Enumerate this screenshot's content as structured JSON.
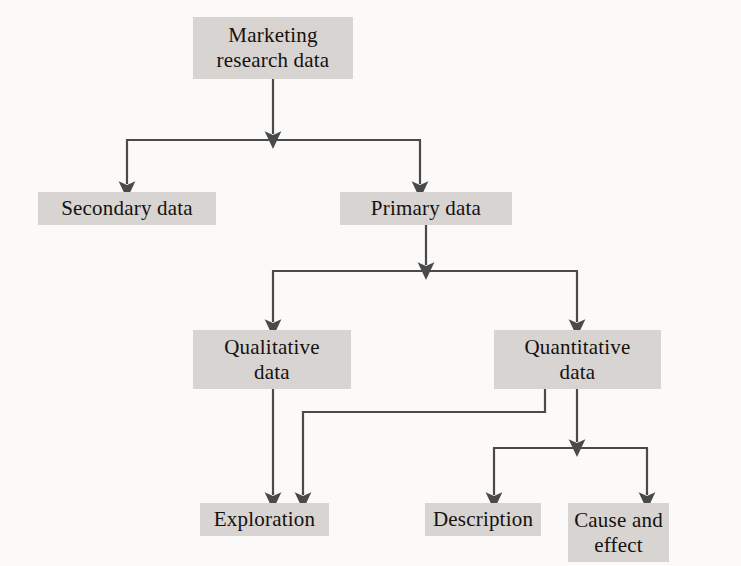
{
  "diagram": {
    "node_fill": "#d7d4d1",
    "line_color": "#4a4a4a",
    "background": "#fbfaf8",
    "nodes": [
      {
        "id": "root",
        "label": "Marketing\nresearch data"
      },
      {
        "id": "secondary",
        "label": "Secondary data"
      },
      {
        "id": "primary",
        "label": "Primary data"
      },
      {
        "id": "qualitative",
        "label": "Qualitative\ndata"
      },
      {
        "id": "quantitative",
        "label": "Quantitative\ndata"
      },
      {
        "id": "exploration",
        "label": "Exploration"
      },
      {
        "id": "description",
        "label": "Description"
      },
      {
        "id": "cause",
        "label": "Cause and\neffect"
      }
    ],
    "edges": [
      {
        "from": "root",
        "to": "secondary"
      },
      {
        "from": "root",
        "to": "primary"
      },
      {
        "from": "primary",
        "to": "qualitative"
      },
      {
        "from": "primary",
        "to": "quantitative"
      },
      {
        "from": "qualitative",
        "to": "exploration"
      },
      {
        "from": "quantitative",
        "to": "exploration"
      },
      {
        "from": "quantitative",
        "to": "description"
      },
      {
        "from": "quantitative",
        "to": "cause"
      }
    ]
  }
}
